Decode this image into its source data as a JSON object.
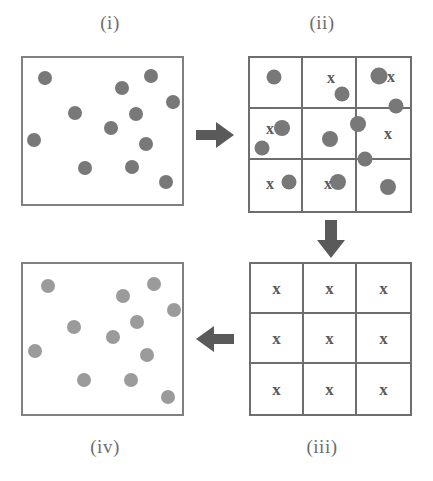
{
  "figure": {
    "colors": {
      "dot_dark": "#787878",
      "dot_light": "#9b9b9b",
      "stroke": "#6e6e6e",
      "box_stroke": "#808080",
      "label_text": "#6d6d6d",
      "mark_text": "#5a5a5a",
      "background": "#ffffff"
    },
    "labels": {
      "i": "(i)",
      "ii": "(ii)",
      "iii": "(iii)",
      "iv": "(iv)"
    },
    "arrows": [
      {
        "name": "arrow-right",
        "direction": "right",
        "from": "(i)",
        "to": "(ii)"
      },
      {
        "name": "arrow-down",
        "direction": "down",
        "from": "(ii)",
        "to": "(iii)"
      },
      {
        "name": "arrow-left",
        "direction": "left",
        "from": "(iii)",
        "to": "(iv)"
      }
    ],
    "panel_i": {
      "label": "(i)",
      "shape": "box",
      "point_count": 13,
      "dot_color": "#787878",
      "points": [
        {
          "x": 22,
          "y": 20,
          "d": 14
        },
        {
          "x": 99,
          "y": 30,
          "d": 14
        },
        {
          "x": 128,
          "y": 18,
          "d": 14
        },
        {
          "x": 150,
          "y": 44,
          "d": 14
        },
        {
          "x": 113,
          "y": 56,
          "d": 14
        },
        {
          "x": 52,
          "y": 55,
          "d": 14
        },
        {
          "x": 88,
          "y": 70,
          "d": 14
        },
        {
          "x": 11,
          "y": 82,
          "d": 14
        },
        {
          "x": 123,
          "y": 86,
          "d": 14
        },
        {
          "x": 62,
          "y": 110,
          "d": 14
        },
        {
          "x": 109,
          "y": 109,
          "d": 14
        },
        {
          "x": 143,
          "y": 124,
          "d": 14
        }
      ]
    },
    "panel_ii": {
      "label": "(ii)",
      "shape": "grid",
      "rows": 3,
      "columns": 3,
      "cell_marks": [
        "x",
        "x",
        "x",
        "x",
        "x",
        "x",
        "x",
        "x",
        "x"
      ],
      "visible_x_marks": [
        {
          "cell": "row1-col2",
          "x": 83,
          "y": 22
        },
        {
          "cell": "row1-col3",
          "x": 143,
          "y": 21
        },
        {
          "cell": "row2-col1",
          "x": 22,
          "y": 73
        },
        {
          "cell": "row2-col3",
          "x": 140,
          "y": 78
        },
        {
          "cell": "row3-col1",
          "x": 22,
          "y": 128
        },
        {
          "cell": "row3-col2",
          "x": 80,
          "y": 128
        }
      ],
      "point_count": 12,
      "dot_color": "#787878",
      "points": [
        {
          "x": 26,
          "y": 21,
          "d": 15
        },
        {
          "x": 94,
          "y": 38,
          "d": 15
        },
        {
          "x": 131,
          "y": 20,
          "d": 17
        },
        {
          "x": 148,
          "y": 50,
          "d": 15
        },
        {
          "x": 34,
          "y": 72,
          "d": 16
        },
        {
          "x": 14,
          "y": 92,
          "d": 15
        },
        {
          "x": 82,
          "y": 83,
          "d": 16
        },
        {
          "x": 110,
          "y": 68,
          "d": 16
        },
        {
          "x": 117,
          "y": 103,
          "d": 15
        },
        {
          "x": 41,
          "y": 126,
          "d": 15
        },
        {
          "x": 90,
          "y": 126,
          "d": 16
        },
        {
          "x": 140,
          "y": 131,
          "d": 16
        }
      ]
    },
    "panel_iii": {
      "label": "(iii)",
      "shape": "grid",
      "rows": 3,
      "columns": 3,
      "point_count": 0,
      "cells": [
        {
          "row": 1,
          "col": 1,
          "mark": "x"
        },
        {
          "row": 1,
          "col": 2,
          "mark": "x"
        },
        {
          "row": 1,
          "col": 3,
          "mark": "x"
        },
        {
          "row": 2,
          "col": 1,
          "mark": "x"
        },
        {
          "row": 2,
          "col": 2,
          "mark": "x"
        },
        {
          "row": 2,
          "col": 3,
          "mark": "x"
        },
        {
          "row": 3,
          "col": 1,
          "mark": "x"
        },
        {
          "row": 3,
          "col": 2,
          "mark": "x"
        },
        {
          "row": 3,
          "col": 3,
          "mark": "x"
        }
      ]
    },
    "panel_iv": {
      "label": "(iv)",
      "shape": "box",
      "point_count": 13,
      "dot_color": "#9b9b9b",
      "points": [
        {
          "x": 25,
          "y": 22,
          "d": 14
        },
        {
          "x": 100,
          "y": 32,
          "d": 14
        },
        {
          "x": 131,
          "y": 20,
          "d": 14
        },
        {
          "x": 151,
          "y": 46,
          "d": 14
        },
        {
          "x": 114,
          "y": 58,
          "d": 14
        },
        {
          "x": 51,
          "y": 63,
          "d": 14
        },
        {
          "x": 90,
          "y": 73,
          "d": 14
        },
        {
          "x": 12,
          "y": 87,
          "d": 14
        },
        {
          "x": 124,
          "y": 91,
          "d": 14
        },
        {
          "x": 61,
          "y": 116,
          "d": 14
        },
        {
          "x": 108,
          "y": 116,
          "d": 14
        },
        {
          "x": 145,
          "y": 133,
          "d": 14
        }
      ]
    }
  }
}
